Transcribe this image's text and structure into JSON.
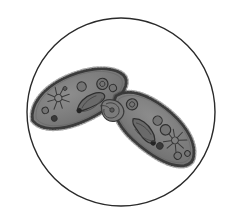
{
  "figure": {
    "title": "Two conjugating ciliate protozoa (Paramecium) in circular microscope field of view",
    "caption": "",
    "background_color": "#ffffff",
    "field_of_view": {
      "shape": "circle",
      "center_x": 121,
      "center_y": 112,
      "radius": 94,
      "stroke_color": "#2a2a2a",
      "stroke_width": 1.4,
      "fill_color": "#ffffff",
      "label": "microscope-field-circle"
    },
    "palette": {
      "cytoplasm_gray": "#7c7c7c",
      "cytoplasm_gray_light": "#8a8a8a",
      "cytoplasm_gray_dark": "#6e6e6e",
      "membrane_outline": "#3a3a3a",
      "cilia_fringe": "#343434",
      "organelle_dark": "#2e2e2e",
      "organelle_mid": "#555555",
      "highlight": "#9a9a9a",
      "circle_line": "#2a2a2a"
    },
    "organisms": [
      {
        "id": "left-cell",
        "name": "Left conjugating ciliate cell",
        "orientation_degrees": -24,
        "center_x": 78,
        "center_y": 98,
        "length": 100,
        "width": 44,
        "fill": "#7c7c7c",
        "outline": "#3a3a3a",
        "organelles": [
          {
            "type": "contractile-vacuole",
            "label": "contractile vacuole",
            "x": -18,
            "y": -8,
            "radius": 9,
            "rays": 8
          },
          {
            "type": "macronucleus",
            "label": "macronucleus",
            "x": 10,
            "y": 8,
            "rx": 16,
            "ry": 6
          },
          {
            "type": "food-vacuole",
            "label": "food vacuole",
            "x": 8,
            "y": -9,
            "r": 5
          },
          {
            "type": "food-vacuole",
            "label": "food vacuole",
            "x": 28,
            "y": -3,
            "r": 6
          },
          {
            "type": "food-vacuole",
            "label": "food vacuole",
            "x": -35,
            "y": -2,
            "r": 3.5
          },
          {
            "type": "food-vacuole",
            "label": "food vacuole",
            "x": -30,
            "y": 9,
            "r": 3
          },
          {
            "type": "food-vacuole",
            "label": "food vacuole",
            "x": -4,
            "y": 12,
            "r": 3
          },
          {
            "type": "food-vacuole",
            "label": "food vacuole",
            "x": 36,
            "y": 5,
            "r": 4
          }
        ]
      },
      {
        "id": "right-cell",
        "name": "Right conjugating ciliate cell",
        "orientation_degrees": 40,
        "center_x": 154,
        "center_y": 128,
        "length": 98,
        "width": 42,
        "fill": "#7c7c7c",
        "outline": "#3a3a3a",
        "organelles": [
          {
            "type": "contractile-vacuole",
            "label": "contractile vacuole",
            "x": 24,
            "y": -4,
            "radius": 9,
            "rays": 8
          },
          {
            "type": "macronucleus",
            "label": "macronucleus",
            "x": -6,
            "y": 8,
            "rx": 16,
            "ry": 6
          },
          {
            "type": "food-vacuole",
            "label": "food vacuole",
            "x": -2,
            "y": -8,
            "r": 5
          },
          {
            "type": "food-vacuole",
            "label": "food vacuole",
            "x": 10,
            "y": -6,
            "r": 5.5
          },
          {
            "type": "food-vacuole",
            "label": "food vacuole",
            "x": -32,
            "y": -4,
            "r": 6
          },
          {
            "type": "food-vacuole",
            "label": "food vacuole",
            "x": 36,
            "y": 6,
            "r": 4
          },
          {
            "type": "food-vacuole",
            "label": "food vacuole",
            "x": 42,
            "y": -2,
            "r": 3
          },
          {
            "type": "food-vacuole",
            "label": "food vacuole",
            "x": 16,
            "y": 10,
            "r": 3.5
          }
        ]
      }
    ],
    "conjugation_bridge": {
      "label": "conjugation junction",
      "x": 113,
      "y": 111
    }
  }
}
